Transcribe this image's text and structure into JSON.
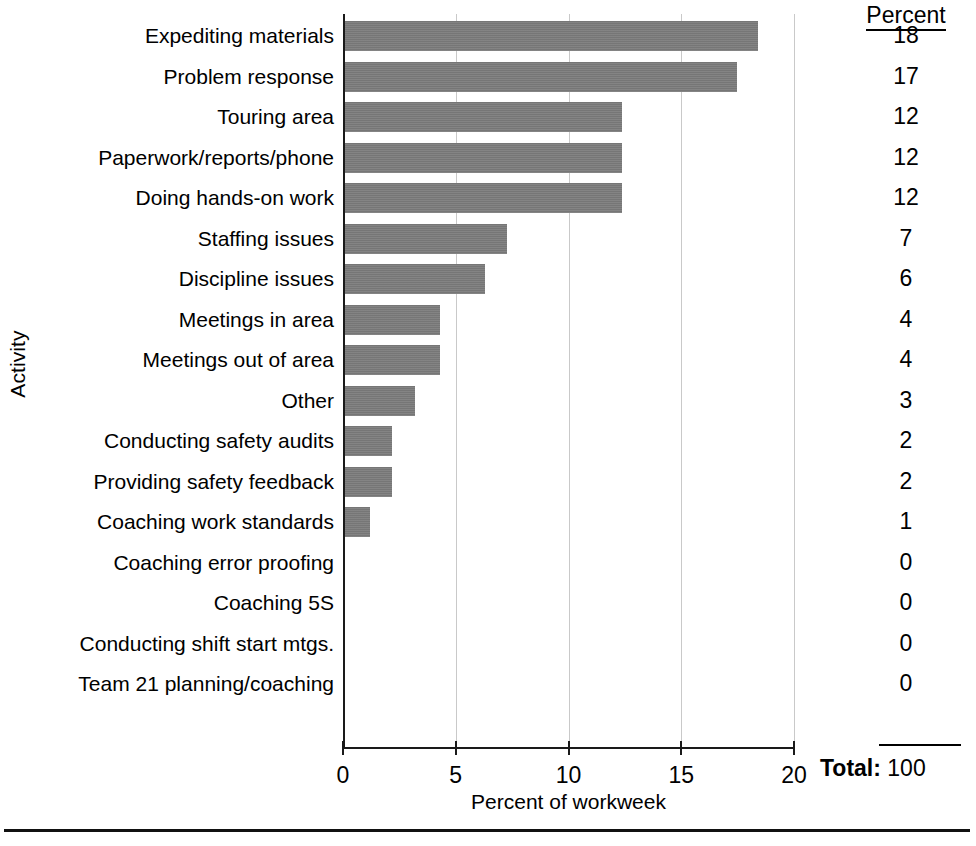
{
  "chart_data": {
    "type": "bar",
    "orientation": "horizontal",
    "title": "",
    "xlabel": "Percent of workweek",
    "ylabel": "Activity",
    "xlim": [
      0,
      20
    ],
    "xticks": [
      0,
      5,
      10,
      15,
      20
    ],
    "xtick_labels": [
      "0",
      "5",
      "10",
      "15",
      "20"
    ],
    "grid": "vertical",
    "legend": "none",
    "bar_color": "#7c7c7c",
    "categories": [
      "Expediting materials",
      "Problem response",
      "Touring area",
      "Paperwork/reports/phone",
      "Doing hands-on work",
      "Staffing issues",
      "Discipline issues",
      "Meetings in area",
      "Meetings out of area",
      "Other",
      "Conducting safety audits",
      "Providing safety feedback",
      "Coaching work standards",
      "Coaching error proofing",
      "Coaching 5S",
      "Conducting shift start mtgs.",
      "Team 21 planning/coaching"
    ],
    "values": [
      18.3,
      17.4,
      12.3,
      12.3,
      12.3,
      7.2,
      6.2,
      4.2,
      4.2,
      3.1,
      2.1,
      2.1,
      1.1,
      0,
      0,
      0,
      0
    ],
    "labels": [
      "18",
      "17",
      "12",
      "12",
      "12",
      "7",
      "6",
      "4",
      "4",
      "3",
      "2",
      "2",
      "1",
      "0",
      "0",
      "0",
      "0"
    ]
  },
  "table": {
    "percent_header": "Percent",
    "total_label": "Total:",
    "total_value": "100"
  }
}
